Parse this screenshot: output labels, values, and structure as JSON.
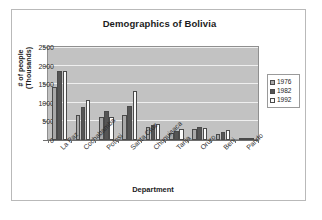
{
  "chart_data": {
    "type": "bar",
    "title": "Demographics of Bolivia",
    "xlabel": "Department",
    "ylabel": "# of people (Thousands)",
    "ylabel_line1": "# of people",
    "ylabel_line2": "(Thousands)",
    "categories": [
      "La Paz",
      "Cochabamba",
      "Potosi",
      "Santa Cruz",
      "Chuquisaca",
      "Tarija",
      "Oruro",
      "Beni",
      "Pando"
    ],
    "series": [
      {
        "name": "1976",
        "color": "#a8a8a8",
        "values": [
          1450,
          700,
          630,
          680,
          360,
          190,
          310,
          170,
          35
        ]
      },
      {
        "name": "1982",
        "color": "#555555",
        "values": [
          1900,
          900,
          810,
          940,
          400,
          250,
          350,
          210,
          45
        ]
      },
      {
        "name": "1992",
        "color": "#fbfbfb",
        "values": [
          1900,
          1100,
          620,
          1340,
          430,
          290,
          340,
          280,
          40
        ]
      }
    ],
    "ylim": [
      0,
      2500
    ],
    "yticks": [
      0,
      500,
      1000,
      1500,
      2000,
      2500
    ],
    "ytick_labels": [
      "0",
      "500",
      "1000",
      "1500",
      "2000",
      "2500"
    ],
    "grid": true,
    "legend_position": "right",
    "plot_background": "#c2c2c2",
    "gridline_color": "#efefef"
  }
}
